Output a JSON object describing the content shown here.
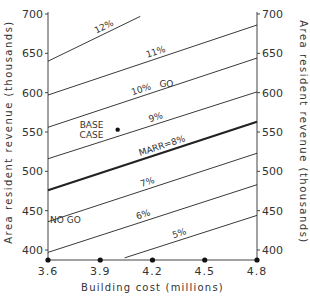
{
  "chart_data": {
    "type": "line",
    "title": "",
    "xlabel": "Building cost (millions)",
    "ylabel": "Area resident revenue (thousands)",
    "ylabel_right": "Area resident revenue (thousands)",
    "xlim": [
      3.6,
      4.8
    ],
    "ylim": [
      390,
      700
    ],
    "x_ticks": [
      3.6,
      3.9,
      4.2,
      4.5,
      4.8
    ],
    "x_tick_labels": [
      "3.6",
      "3.9",
      "4.2",
      "4.5",
      "4.8"
    ],
    "y_ticks": [
      400,
      450,
      500,
      550,
      600,
      650,
      700
    ],
    "y_tick_labels": [
      "400",
      "450",
      "500",
      "550",
      "600",
      "650",
      "700"
    ],
    "grid": false,
    "series": [
      {
        "name": "12%",
        "label": "12%",
        "x": [
          3.6,
          4.13
        ],
        "y": [
          640,
          697
        ],
        "bold": false
      },
      {
        "name": "11%",
        "label": "11%",
        "x": [
          3.6,
          4.8
        ],
        "y": [
          597,
          686
        ],
        "bold": false
      },
      {
        "name": "10%",
        "label": "10%",
        "x": [
          3.6,
          4.8
        ],
        "y": [
          556,
          644
        ],
        "bold": false
      },
      {
        "name": "9%",
        "label": "9%",
        "x": [
          3.6,
          4.8
        ],
        "y": [
          516,
          601
        ],
        "bold": false
      },
      {
        "name": "MARR=8%",
        "label": "MARR=8%",
        "x": [
          3.6,
          4.8
        ],
        "y": [
          476,
          563
        ],
        "bold": true
      },
      {
        "name": "7%",
        "label": "7%",
        "x": [
          3.6,
          4.8
        ],
        "y": [
          436,
          523
        ],
        "bold": false
      },
      {
        "name": "6%",
        "label": "6%",
        "x": [
          3.6,
          4.8
        ],
        "y": [
          397,
          483
        ],
        "bold": false
      },
      {
        "name": "5%",
        "label": "5%",
        "x": [
          4.04,
          4.8
        ],
        "y": [
          390,
          444
        ],
        "bold": false
      }
    ],
    "points": [
      {
        "name": "BASE CASE",
        "x": 4.0,
        "y": 553
      }
    ],
    "axis_markers_x": [
      3.6,
      3.9,
      4.2,
      4.5,
      4.8
    ],
    "annotations": [
      {
        "text": "BASE",
        "x": 3.85,
        "y": 560
      },
      {
        "text": "CASE",
        "x": 3.85,
        "y": 547
      },
      {
        "text": "GO",
        "x": 4.28,
        "y": 612
      },
      {
        "text": "NO GO",
        "x": 3.7,
        "y": 440
      }
    ]
  }
}
